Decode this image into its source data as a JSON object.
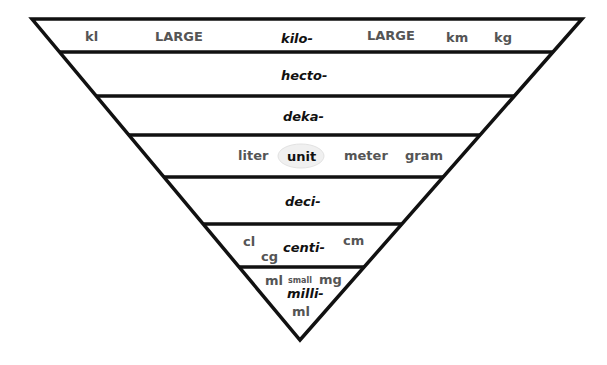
{
  "colors": {
    "line": "#111111",
    "prefix_text": "#111111",
    "unit_text": "#555555",
    "unit_highlight": "#eeeeee"
  },
  "rows": [
    {
      "prefix": "kilo-",
      "labels": {
        "left_unit": "kl",
        "left_size": "LARGE",
        "right_size": "LARGE",
        "unit_a": "km",
        "unit_b": "kg"
      }
    },
    {
      "prefix": "hecto-"
    },
    {
      "prefix": "deka-"
    },
    {
      "prefix": "unit",
      "labels": {
        "liter": "liter",
        "meter": "meter",
        "gram": "gram"
      }
    },
    {
      "prefix": "deci-"
    },
    {
      "prefix": "centi-",
      "labels": {
        "cl": "cl",
        "cg": "cg",
        "cm": "cm"
      }
    },
    {
      "prefix": "milli-",
      "labels": {
        "ml_left": "ml",
        "size": "small",
        "mg": "mg",
        "ml_bottom": "ml"
      }
    }
  ]
}
